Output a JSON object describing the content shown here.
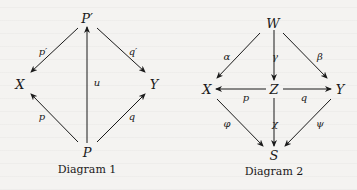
{
  "diagram1": {
    "caption": "Diagram 1",
    "nodes": {
      "top": "P′",
      "left": "X",
      "right": "Y",
      "bottom": "P"
    },
    "arrows": [
      {
        "from": "P′",
        "to": "X",
        "label": "p′"
      },
      {
        "from": "P′",
        "to": "Y",
        "label": "q′"
      },
      {
        "from": "P",
        "to": "P′",
        "label": "u"
      },
      {
        "from": "P",
        "to": "X",
        "label": "p"
      },
      {
        "from": "P",
        "to": "Y",
        "label": "q"
      }
    ],
    "labels": {
      "p_prime": "p′",
      "q_prime": "q′",
      "u": "u",
      "p": "p",
      "q": "q"
    }
  },
  "diagram2": {
    "caption": "Diagram 2",
    "nodes": {
      "top": "W",
      "left": "X",
      "center": "Z",
      "right": "Y",
      "bottom": "S"
    },
    "arrows": [
      {
        "from": "W",
        "to": "X",
        "label": "α"
      },
      {
        "from": "W",
        "to": "Y",
        "label": "β"
      },
      {
        "from": "W",
        "to": "Z",
        "label": "γ"
      },
      {
        "from": "Z",
        "to": "X",
        "label": "p"
      },
      {
        "from": "Z",
        "to": "Y",
        "label": "q"
      },
      {
        "from": "X",
        "to": "S",
        "label": "φ"
      },
      {
        "from": "Y",
        "to": "S",
        "label": "ψ"
      },
      {
        "from": "Z",
        "to": "S",
        "label": "χ"
      }
    ],
    "labels": {
      "alpha": "α",
      "beta": "β",
      "gamma": "γ",
      "p": "p",
      "q": "q",
      "phi": "φ",
      "psi": "ψ",
      "chi": "χ"
    }
  }
}
